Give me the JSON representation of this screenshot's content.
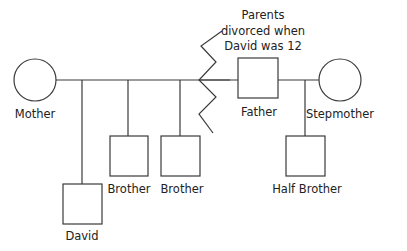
{
  "diagram": {
    "type": "genogram",
    "colors": {
      "stroke": "#3a3a3a",
      "text": "#222222",
      "background": "#ffffff"
    },
    "people": {
      "mother": {
        "label": "Mother",
        "shape": "circle"
      },
      "father": {
        "label": "Father",
        "shape": "square"
      },
      "stepmother": {
        "label": "Stepmother",
        "shape": "circle"
      },
      "david": {
        "label": "David",
        "shape": "square"
      },
      "brother1": {
        "label": "Brother",
        "shape": "square"
      },
      "brother2": {
        "label": "Brother",
        "shape": "square"
      },
      "half_brother": {
        "label": "Half Brother",
        "shape": "square"
      }
    },
    "annotation": {
      "line1": "Parents",
      "line2": "divorced when",
      "line3": "David was 12"
    },
    "relationships": [
      {
        "from": "mother",
        "to": "father",
        "type": "divorced"
      },
      {
        "from": "father",
        "to": "stepmother",
        "type": "married"
      }
    ]
  }
}
